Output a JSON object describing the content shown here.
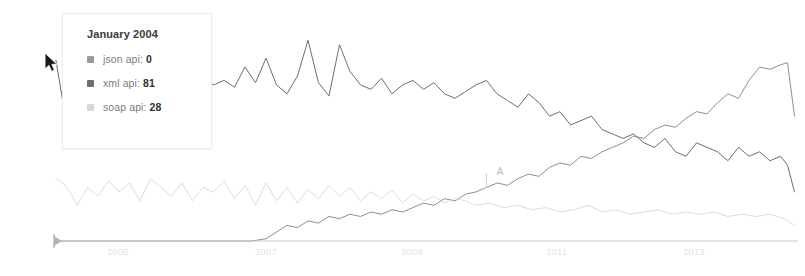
{
  "tooltip": {
    "title": "January 2004",
    "rows": [
      {
        "label": "json api:",
        "value": "0",
        "color": "#9a9a9a",
        "series": "json api"
      },
      {
        "label": "xml api:",
        "value": "81",
        "color": "#6e6e6e",
        "series": "xml api"
      },
      {
        "label": "soap api:",
        "value": "28",
        "color": "#d8d8d8",
        "series": "soap api"
      }
    ]
  },
  "annotation": {
    "label": "A"
  },
  "axis": {
    "tick_labels": [
      "2005",
      "2007",
      "2009",
      "2011",
      "2013"
    ],
    "line_color": "#c9c9c9"
  },
  "chart_data": {
    "type": "line",
    "title": "",
    "subtitle": "",
    "xlabel": "",
    "ylabel": "",
    "grid": false,
    "legend_position": "tooltip",
    "xlim": [
      2004,
      2014.6
    ],
    "ylim": [
      0,
      100
    ],
    "xticks": [
      2005,
      2007,
      2009,
      2011,
      2013
    ],
    "annotations": [
      {
        "label": "A",
        "x": 2010.15,
        "y": 24,
        "series": "json api"
      }
    ],
    "hover_point": {
      "x_label": "January 2004",
      "x": 2004.0
    },
    "series": [
      {
        "name": "json api",
        "color": "#8f8f8f",
        "style": "solid",
        "x": [
          2004.0,
          2004.25,
          2004.5,
          2004.75,
          2005.0,
          2005.25,
          2005.5,
          2005.75,
          2006.0,
          2006.2,
          2006.4,
          2006.6,
          2006.8,
          2007.0,
          2007.15,
          2007.3,
          2007.45,
          2007.6,
          2007.75,
          2007.9,
          2008.05,
          2008.2,
          2008.35,
          2008.5,
          2008.65,
          2008.8,
          2008.95,
          2009.1,
          2009.25,
          2009.4,
          2009.55,
          2009.7,
          2009.85,
          2010.0,
          2010.15,
          2010.3,
          2010.45,
          2010.6,
          2010.75,
          2010.9,
          2011.05,
          2011.2,
          2011.35,
          2011.5,
          2011.65,
          2011.8,
          2011.95,
          2012.1,
          2012.25,
          2012.4,
          2012.55,
          2012.7,
          2012.85,
          2013.0,
          2013.15,
          2013.3,
          2013.45,
          2013.6,
          2013.75,
          2013.9,
          2014.05,
          2014.2,
          2014.35,
          2014.45,
          2014.55
        ],
        "values": [
          0,
          0,
          0,
          0,
          0,
          0,
          0,
          0,
          0,
          0,
          0,
          0,
          0,
          1,
          4,
          7,
          6,
          9,
          8,
          11,
          10,
          12,
          11,
          13,
          12,
          14,
          13,
          15,
          17,
          16,
          19,
          18,
          21,
          22,
          24,
          26,
          25,
          28,
          30,
          29,
          33,
          35,
          34,
          38,
          37,
          40,
          42,
          44,
          47,
          46,
          50,
          52,
          51,
          55,
          58,
          57,
          62,
          66,
          64,
          72,
          78,
          77,
          79,
          80,
          56
        ]
      },
      {
        "name": "xml api",
        "color": "#6e6e6e",
        "style": "solid",
        "x": [
          2004.0,
          2004.1,
          2004.2,
          2004.3,
          2004.45,
          2004.6,
          2004.75,
          2004.9,
          2005.05,
          2005.2,
          2005.35,
          2005.5,
          2005.65,
          2005.8,
          2005.95,
          2006.1,
          2006.25,
          2006.4,
          2006.55,
          2006.7,
          2006.85,
          2007.0,
          2007.15,
          2007.3,
          2007.45,
          2007.6,
          2007.75,
          2007.9,
          2008.05,
          2008.2,
          2008.35,
          2008.5,
          2008.65,
          2008.8,
          2008.95,
          2009.1,
          2009.25,
          2009.4,
          2009.55,
          2009.7,
          2009.85,
          2010.0,
          2010.15,
          2010.3,
          2010.45,
          2010.6,
          2010.75,
          2010.9,
          2011.05,
          2011.2,
          2011.35,
          2011.5,
          2011.65,
          2011.8,
          2011.95,
          2012.1,
          2012.25,
          2012.4,
          2012.55,
          2012.7,
          2012.85,
          2013.0,
          2013.15,
          2013.3,
          2013.45,
          2013.6,
          2013.75,
          2013.9,
          2014.05,
          2014.2,
          2014.35,
          2014.45,
          2014.55
        ],
        "values": [
          81,
          62,
          75,
          88,
          86,
          76,
          79,
          74,
          84,
          80,
          96,
          98,
          93,
          88,
          75,
          73,
          70,
          72,
          69,
          78,
          71,
          82,
          70,
          66,
          74,
          90,
          71,
          65,
          88,
          76,
          70,
          68,
          73,
          66,
          70,
          72,
          68,
          71,
          66,
          64,
          67,
          70,
          72,
          66,
          63,
          60,
          66,
          62,
          56,
          58,
          52,
          54,
          56,
          50,
          48,
          46,
          48,
          44,
          42,
          46,
          40,
          38,
          44,
          42,
          40,
          36,
          42,
          38,
          40,
          36,
          38,
          34,
          22
        ]
      },
      {
        "name": "soap api",
        "color": "#dcdcdc",
        "style": "solid",
        "x": [
          2004.0,
          2004.1,
          2004.2,
          2004.3,
          2004.45,
          2004.6,
          2004.75,
          2004.9,
          2005.05,
          2005.2,
          2005.35,
          2005.5,
          2005.65,
          2005.8,
          2005.95,
          2006.1,
          2006.25,
          2006.4,
          2006.55,
          2006.7,
          2006.85,
          2007.0,
          2007.15,
          2007.3,
          2007.45,
          2007.6,
          2007.75,
          2007.9,
          2008.05,
          2008.2,
          2008.35,
          2008.5,
          2008.65,
          2008.8,
          2008.95,
          2009.1,
          2009.25,
          2009.4,
          2009.55,
          2009.7,
          2009.85,
          2010.0,
          2010.2,
          2010.4,
          2010.6,
          2010.8,
          2011.0,
          2011.2,
          2011.4,
          2011.6,
          2011.8,
          2012.0,
          2012.2,
          2012.4,
          2012.6,
          2012.8,
          2013.0,
          2013.2,
          2013.4,
          2013.6,
          2013.8,
          2014.0,
          2014.2,
          2014.4,
          2014.55
        ],
        "values": [
          28,
          26,
          22,
          16,
          24,
          20,
          27,
          22,
          26,
          18,
          28,
          24,
          20,
          26,
          18,
          24,
          22,
          27,
          19,
          25,
          16,
          26,
          18,
          24,
          17,
          23,
          19,
          25,
          20,
          24,
          18,
          22,
          19,
          23,
          17,
          21,
          18,
          20,
          17,
          19,
          18,
          16,
          17,
          15,
          16,
          14,
          15,
          13,
          14,
          16,
          13,
          14,
          12,
          13,
          14,
          12,
          13,
          12,
          13,
          11,
          12,
          11,
          12,
          10,
          7
        ]
      }
    ]
  }
}
